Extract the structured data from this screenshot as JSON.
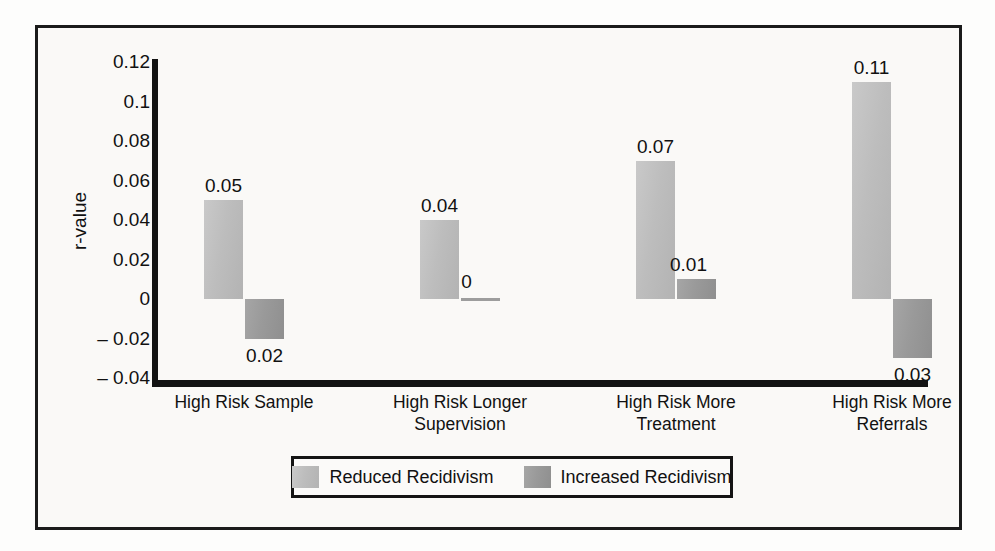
{
  "chart_data": {
    "type": "bar",
    "title": "",
    "xlabel": "",
    "ylabel": "r-value",
    "ylim": [
      -0.04,
      0.12
    ],
    "grid": false,
    "legend_position": "bottom",
    "yticks": [
      "0.12",
      "0.1",
      "0.08",
      "0.06",
      "0.04",
      "0.02",
      "0",
      "– 0.02",
      "– 0.04"
    ],
    "ytick_values": [
      0.12,
      0.1,
      0.08,
      0.06,
      0.04,
      0.02,
      0,
      -0.02,
      -0.04
    ],
    "categories": [
      "High Risk Sample",
      "High Risk Longer Supervision",
      "High Risk More Treatment",
      "High Risk More Referrals"
    ],
    "category_lines": [
      [
        "High Risk Sample"
      ],
      [
        "High Risk Longer",
        "Supervision"
      ],
      [
        "High Risk More",
        "Treatment"
      ],
      [
        "High Risk More",
        "Referrals"
      ]
    ],
    "series": [
      {
        "name": "Reduced Recidivism",
        "color": "#bdbdbd",
        "values": [
          0.05,
          0.04,
          0.07,
          0.11
        ],
        "labels": [
          "0.05",
          "0.04",
          "0.07",
          "0.11"
        ],
        "label_positions": [
          "above",
          "above",
          "above",
          "above"
        ]
      },
      {
        "name": "Increased Recidivism",
        "color": "#9a9a9a",
        "values": [
          -0.02,
          0,
          0.01,
          -0.03
        ],
        "labels": [
          "0.02",
          "0",
          "0.01",
          "0.03"
        ],
        "label_positions": [
          "below",
          "above",
          "above",
          "below"
        ]
      }
    ]
  },
  "legend": {
    "items": [
      {
        "label": "Reduced Recidivism",
        "swatch": "light"
      },
      {
        "label": "Increased Recidivism",
        "swatch": "dark"
      }
    ]
  }
}
